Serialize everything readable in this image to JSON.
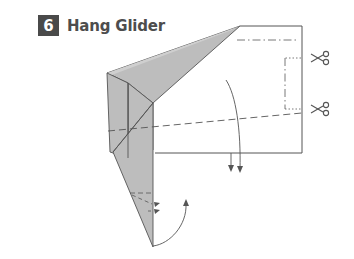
{
  "step": {
    "number": "6",
    "title": "Hang Glider"
  },
  "diagram": {
    "colors": {
      "paper_fill": "#ffffff",
      "folded_fill": "#bdbdbd",
      "line": "#555555",
      "badge_bg": "#4a4a4a",
      "badge_text": "#ffffff",
      "title_text": "#4d4d4d"
    },
    "icons": {
      "scissors_top": "scissors-icon",
      "scissors_bottom": "scissors-icon"
    }
  }
}
